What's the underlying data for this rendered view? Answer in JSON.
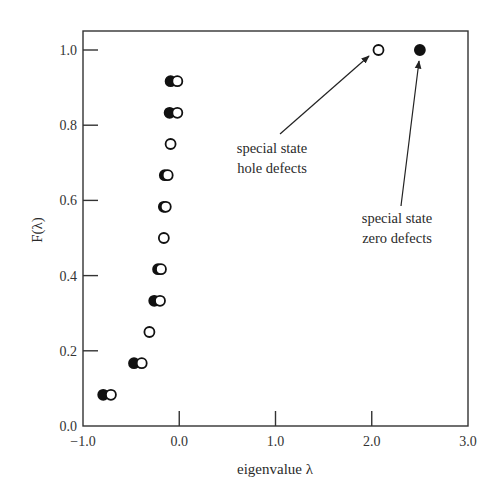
{
  "chart_data": {
    "type": "scatter",
    "title": "",
    "xlabel": "eigenvalue λ",
    "ylabel": "F(λ)",
    "xlim": [
      -1.0,
      3.0
    ],
    "ylim": [
      0.0,
      1.05
    ],
    "xticks": [
      -1.0,
      0.0,
      1.0,
      2.0,
      3.0
    ],
    "xtick_labels": [
      "−1.0",
      "0.0",
      "1.0",
      "2.0",
      "3.0"
    ],
    "yticks": [
      0.0,
      0.2,
      0.4,
      0.6,
      0.8,
      1.0
    ],
    "ytick_labels": [
      "0.0",
      "0.2",
      "0.4",
      "0.6",
      "0.8",
      "1.0"
    ],
    "grid": false,
    "legend": null,
    "series": [
      {
        "name": "zero defects",
        "marker": "filled-circle",
        "color": "#111111",
        "points": [
          {
            "x": -0.79,
            "y": 0.083
          },
          {
            "x": -0.47,
            "y": 0.167
          },
          {
            "x": -0.26,
            "y": 0.333
          },
          {
            "x": -0.22,
            "y": 0.417
          },
          {
            "x": -0.16,
            "y": 0.583
          },
          {
            "x": -0.15,
            "y": 0.667
          },
          {
            "x": -0.1,
            "y": 0.833
          },
          {
            "x": -0.09,
            "y": 0.917
          },
          {
            "x": 2.5,
            "y": 1.0
          }
        ]
      },
      {
        "name": "hole defects",
        "marker": "open-circle",
        "color": "#111111",
        "points": [
          {
            "x": -0.71,
            "y": 0.083
          },
          {
            "x": -0.39,
            "y": 0.167
          },
          {
            "x": -0.31,
            "y": 0.25
          },
          {
            "x": -0.2,
            "y": 0.333
          },
          {
            "x": -0.19,
            "y": 0.417
          },
          {
            "x": -0.16,
            "y": 0.5
          },
          {
            "x": -0.14,
            "y": 0.583
          },
          {
            "x": -0.12,
            "y": 0.667
          },
          {
            "x": -0.09,
            "y": 0.75
          },
          {
            "x": -0.02,
            "y": 0.833
          },
          {
            "x": -0.02,
            "y": 0.917
          },
          {
            "x": 2.07,
            "y": 1.0
          }
        ]
      }
    ],
    "annotations": [
      {
        "lines": [
          "special state",
          "hole defects"
        ],
        "text_pos": {
          "x": 1.0,
          "y": 0.71
        },
        "arrow_to": {
          "x": 2.0,
          "y": 0.99
        }
      },
      {
        "lines": [
          "special state",
          "zero defects"
        ],
        "text_pos": {
          "x": 2.35,
          "y": 0.52
        },
        "arrow_to": {
          "x": 2.5,
          "y": 0.97
        }
      }
    ]
  }
}
